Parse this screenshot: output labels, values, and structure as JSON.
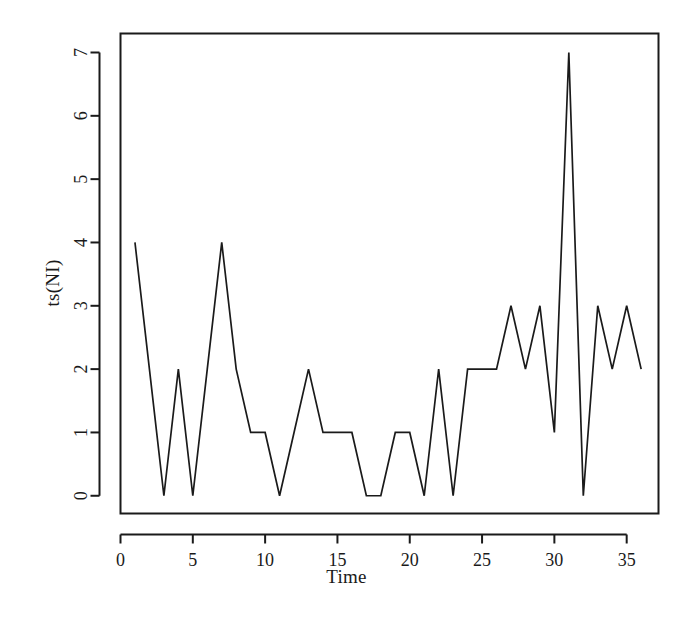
{
  "figure": {
    "background_color": "#ffffff",
    "line_color": "#1a1a1a",
    "axis_color": "#1a1a1a"
  },
  "axes": {
    "x_title": "Time",
    "y_title": "ts(NI)",
    "x_ticks": [
      "0",
      "5",
      "10",
      "15",
      "20",
      "25",
      "30",
      "35"
    ],
    "y_ticks": [
      "0",
      "1",
      "2",
      "3",
      "4",
      "5",
      "6",
      "7"
    ]
  },
  "chart_data": {
    "type": "line",
    "title": "",
    "subtitle": "",
    "xlabel": "Time",
    "ylabel": "ts(NI)",
    "xlim": [
      0.0,
      37.2
    ],
    "ylim": [
      -0.28,
      7.3
    ],
    "xticks": [
      0,
      5,
      10,
      15,
      20,
      25,
      30,
      35
    ],
    "yticks": [
      0,
      1,
      2,
      3,
      4,
      5,
      6,
      7
    ],
    "grid": false,
    "legend": null,
    "legend_position": "none",
    "annotations": [],
    "x": [
      1,
      2,
      3,
      4,
      5,
      6,
      7,
      8,
      9,
      10,
      11,
      12,
      13,
      14,
      15,
      16,
      17,
      18,
      19,
      20,
      21,
      22,
      23,
      24,
      25,
      26,
      27,
      28,
      29,
      30,
      31,
      32,
      33,
      34,
      35,
      36
    ],
    "series": [
      {
        "name": "ts(NI)",
        "color": "#1a1a1a",
        "values": [
          4,
          2,
          0,
          2,
          0,
          2,
          4,
          2,
          1,
          1,
          0,
          1,
          2,
          1,
          1,
          1,
          0,
          0,
          1,
          1,
          0,
          2,
          0,
          2,
          2,
          2,
          3,
          2,
          3,
          1,
          7,
          0,
          3,
          2,
          3,
          2
        ]
      }
    ]
  }
}
